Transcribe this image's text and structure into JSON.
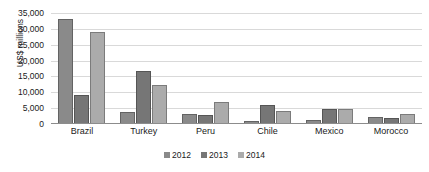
{
  "chart_data": {
    "type": "bar",
    "title": "",
    "xlabel": "",
    "ylabel": "US$ millions",
    "ylim": [
      0,
      35000
    ],
    "grid": true,
    "legend_position": "bottom",
    "categories": [
      "Brazil",
      "Turkey",
      "Peru",
      "Chile",
      "Mexico",
      "Morocco"
    ],
    "ytick_labels": [
      "35,000",
      "30,000",
      "25,000",
      "20,000",
      "15,000",
      "10,000",
      "5,000",
      "0"
    ],
    "ytick_values": [
      35000,
      30000,
      25000,
      20000,
      15000,
      10000,
      5000,
      0
    ],
    "series": [
      {
        "name": "2012",
        "color": "#8a8a8a",
        "values": [
          33200,
          3700,
          3200,
          900,
          1300,
          2200
        ]
      },
      {
        "name": "2013",
        "color": "#767676",
        "values": [
          9000,
          16700,
          3000,
          6000,
          4600,
          1900
        ]
      },
      {
        "name": "2014",
        "color": "#ababab",
        "values": [
          28900,
          12200,
          7000,
          4000,
          4700,
          3300
        ]
      }
    ]
  }
}
